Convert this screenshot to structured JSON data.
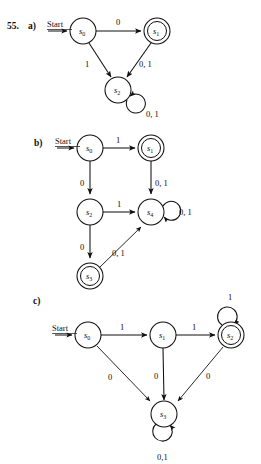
{
  "problem": {
    "number": "55.",
    "parts": [
      "a)",
      "b)",
      "c)"
    ]
  },
  "labels": {
    "start": "Start",
    "zero": "0",
    "one": "1",
    "zero_one_spaced": "0, 1",
    "zero_one_tight": "0,1"
  },
  "diagrams": [
    {
      "id": "a",
      "part_label": "a)",
      "start_label": "Start",
      "start_state": "s0",
      "states": [
        {
          "id": "s0",
          "base": "s",
          "sub": "0",
          "accepting": false,
          "cx": 83,
          "cy": 31,
          "r": 13
        },
        {
          "id": "s1",
          "base": "s",
          "sub": "1",
          "accepting": true,
          "cx": 157,
          "cy": 31,
          "r": 13
        },
        {
          "id": "s2",
          "base": "s",
          "sub": "2",
          "accepting": false,
          "cx": 118,
          "cy": 90,
          "r": 13
        }
      ],
      "transitions": [
        {
          "from": "s0",
          "to": "s1",
          "label": "0",
          "label_x": 119,
          "label_y": 24
        },
        {
          "from": "s0",
          "to": "s2",
          "label": "1",
          "label_x": 88,
          "label_y": 65
        },
        {
          "from": "s1",
          "to": "s2",
          "label": "0, 1",
          "label_x": 140,
          "label_y": 66
        },
        {
          "from": "s2",
          "to": "s2",
          "label": "0, 1",
          "label_x": 148,
          "label_y": 116,
          "self_loop": true
        }
      ]
    },
    {
      "id": "b",
      "part_label": "b)",
      "start_label": "Start",
      "start_state": "s0",
      "states": [
        {
          "id": "s0",
          "base": "s",
          "sub": "0",
          "accepting": false,
          "cx": 90,
          "cy": 148,
          "r": 13
        },
        {
          "id": "s1",
          "base": "s",
          "sub": "1",
          "accepting": true,
          "cx": 151,
          "cy": 148,
          "r": 13
        },
        {
          "id": "s2",
          "base": "s",
          "sub": "2",
          "accepting": false,
          "cx": 90,
          "cy": 212,
          "r": 13
        },
        {
          "id": "s3",
          "base": "s",
          "sub": "3",
          "accepting": true,
          "cx": 90,
          "cy": 276,
          "r": 13
        },
        {
          "id": "s4",
          "base": "s",
          "sub": "4",
          "accepting": false,
          "cx": 151,
          "cy": 212,
          "r": 13
        }
      ],
      "transitions": [
        {
          "from": "s0",
          "to": "s1",
          "label": "1",
          "label_x": 118,
          "label_y": 142
        },
        {
          "from": "s0",
          "to": "s2",
          "label": "0",
          "label_x": 83,
          "label_y": 184
        },
        {
          "from": "s1",
          "to": "s4",
          "label": "0, 1",
          "label_x": 156,
          "label_y": 184
        },
        {
          "from": "s2",
          "to": "s4",
          "label": "1",
          "label_x": 119,
          "label_y": 206
        },
        {
          "from": "s2",
          "to": "s3",
          "label": "0",
          "label_x": 83,
          "label_y": 248
        },
        {
          "from": "s3",
          "to": "s4",
          "label": "0, 1",
          "label_x": 117,
          "label_y": 254
        },
        {
          "from": "s4",
          "to": "s4",
          "label": "0, 1",
          "label_x": 190,
          "label_y": 215,
          "self_loop": true
        }
      ]
    },
    {
      "id": "c",
      "part_label": "c)",
      "start_label": "Start",
      "start_state": "s0",
      "states": [
        {
          "id": "s0",
          "base": "s",
          "sub": "0",
          "accepting": false,
          "cx": 88,
          "cy": 335,
          "r": 13
        },
        {
          "id": "s1",
          "base": "s",
          "sub": "1",
          "accepting": false,
          "cx": 163,
          "cy": 335,
          "r": 13
        },
        {
          "id": "s2",
          "base": "s",
          "sub": "2",
          "accepting": true,
          "cx": 231,
          "cy": 335,
          "r": 13
        },
        {
          "id": "s3",
          "base": "s",
          "sub": "3",
          "accepting": false,
          "cx": 164,
          "cy": 414,
          "r": 13
        }
      ],
      "transitions": [
        {
          "from": "s0",
          "to": "s1",
          "label": "1",
          "label_x": 122,
          "label_y": 329
        },
        {
          "from": "s1",
          "to": "s2",
          "label": "1",
          "label_x": 194,
          "label_y": 329
        },
        {
          "from": "s0",
          "to": "s3",
          "label": "0",
          "label_x": 111,
          "label_y": 378
        },
        {
          "from": "s1",
          "to": "s3",
          "label": "0",
          "label_x": 157,
          "label_y": 377
        },
        {
          "from": "s2",
          "to": "s3",
          "label": "0",
          "label_x": 209,
          "label_y": 377
        },
        {
          "from": "s2",
          "to": "s2",
          "label": "1",
          "label_x": 231,
          "label_y": 297,
          "self_loop": true
        },
        {
          "from": "s3",
          "to": "s3",
          "label": "0,1",
          "label_x": 164,
          "label_y": 459,
          "self_loop": true
        }
      ]
    }
  ]
}
